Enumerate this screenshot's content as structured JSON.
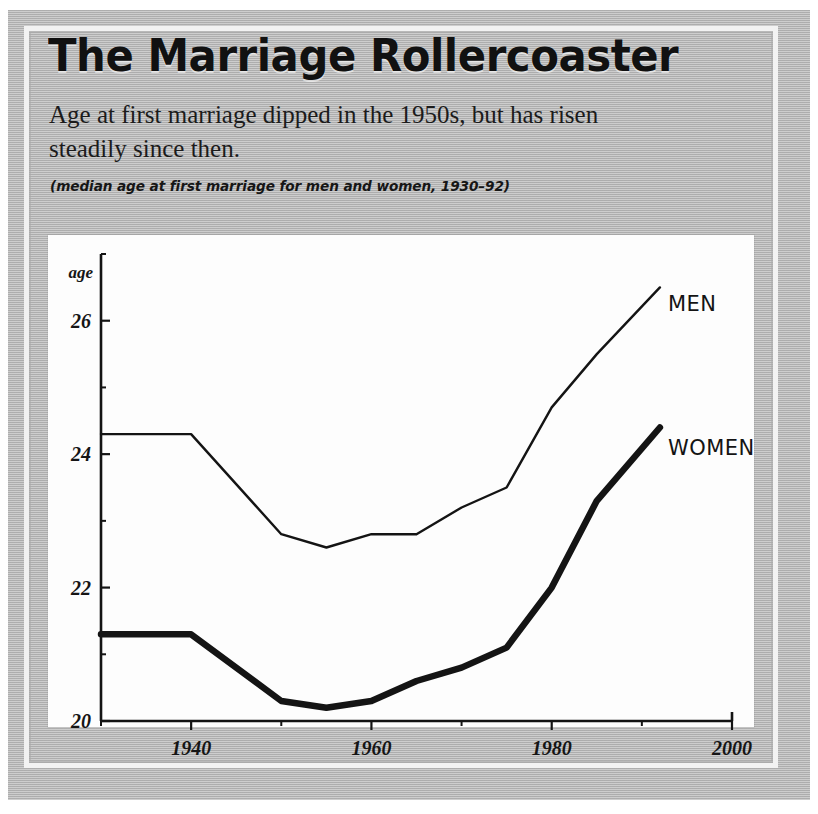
{
  "panel": {
    "headline": "The Marriage Rollercoaster",
    "deck": "Age at first marriage dipped in the 1950s, but has risen steadily since then.",
    "caption": "(median age at first marriage for men and women, 1930–92)",
    "credit": "Sources: U.S. Census Bureau",
    "mat_color": "#b8b8b8",
    "plot_bg": "#fdfdfd",
    "ink": "#141414"
  },
  "chart_data": {
    "type": "line",
    "title": "The Marriage Rollercoaster",
    "subtitle": "Age at first marriage dipped in the 1950s, but has risen steadily since then.",
    "annotation": "(median age at first marriage for men and women, 1930–92)",
    "xlabel": "",
    "ylabel": "age",
    "xlim": [
      1930,
      2000
    ],
    "ylim": [
      20,
      27
    ],
    "grid": false,
    "legend_position": "inline-right",
    "x_ticks_major": [
      1940,
      1960,
      1980,
      2000
    ],
    "x_ticks_minor": [
      1930,
      1950,
      1970,
      1990
    ],
    "x_tick_labels": [
      "1940",
      "1960",
      "1980",
      "2000"
    ],
    "y_ticks_major": [
      20,
      22,
      24,
      26
    ],
    "y_ticks_minor": [
      21,
      23,
      25,
      27
    ],
    "y_tick_labels": [
      "20",
      "22",
      "24",
      "26"
    ],
    "x": [
      1930,
      1940,
      1950,
      1955,
      1960,
      1965,
      1970,
      1975,
      1980,
      1985,
      1992
    ],
    "series": [
      {
        "name": "MEN",
        "label": "MEN",
        "line_width": "thin",
        "color": "#141414",
        "values": [
          24.3,
          24.3,
          22.8,
          22.6,
          22.8,
          22.8,
          23.2,
          23.5,
          24.7,
          25.5,
          26.5
        ]
      },
      {
        "name": "WOMEN",
        "label": "WOMEN",
        "line_width": "thick",
        "color": "#141414",
        "values": [
          21.3,
          21.3,
          20.3,
          20.2,
          20.3,
          20.6,
          20.8,
          21.1,
          22.0,
          23.3,
          24.4
        ]
      }
    ]
  }
}
